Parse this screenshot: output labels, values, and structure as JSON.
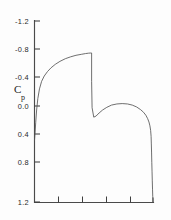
{
  "figure": {
    "background_color": "#fdfdfd",
    "line_color": "#555555",
    "axis_color": "#4a4a4a",
    "text_color": "#2a2a2a"
  },
  "axis": {
    "y_title_main": "C",
    "y_title_sub": "p",
    "y_tick_labels": [
      "-1.2",
      "-0.8",
      "-0.4",
      "0.0",
      "0.4",
      "0.8",
      "1.2"
    ]
  },
  "chart_data": {
    "type": "line",
    "title": "",
    "xlabel": "",
    "ylabel": "Cp",
    "xlim": [
      0,
      1
    ],
    "ylim": [
      1.2,
      -1.2
    ],
    "y_axis_inverted": true,
    "grid": false,
    "legend": null,
    "y_ticks": [
      -1.2,
      -0.8,
      -0.4,
      0.0,
      0.4,
      0.8,
      1.2
    ],
    "y_tick_labels": [
      "-1.2",
      "-0.8",
      "-0.4",
      "0.0",
      "0.4",
      "0.8",
      "1.2"
    ],
    "x_ticks": [
      0.0,
      0.2,
      0.4,
      0.6,
      0.8,
      1.0
    ],
    "x_tick_labels": [
      "",
      "",
      "",
      "",
      "",
      ""
    ],
    "series": [
      {
        "name": "Cp distribution",
        "x": [
          0.0,
          0.004,
          0.01,
          0.018,
          0.028,
          0.042,
          0.06,
          0.082,
          0.11,
          0.14,
          0.175,
          0.215,
          0.26,
          0.305,
          0.35,
          0.395,
          0.43,
          0.455,
          0.47,
          0.478,
          0.482,
          0.482,
          0.486,
          0.5,
          0.52,
          0.545,
          0.575,
          0.61,
          0.65,
          0.695,
          0.74,
          0.785,
          0.825,
          0.862,
          0.895,
          0.92,
          0.94,
          0.955,
          0.966,
          0.974,
          0.98,
          0.984,
          0.986,
          0.988,
          0.99,
          0.992,
          0.994,
          0.996,
          0.998,
          1.0
        ],
        "y": [
          0.38,
          0.3,
          0.15,
          -0.02,
          -0.17,
          -0.3,
          -0.4,
          -0.47,
          -0.53,
          -0.58,
          -0.625,
          -0.665,
          -0.7,
          -0.725,
          -0.745,
          -0.758,
          -0.768,
          -0.773,
          -0.775,
          -0.776,
          -0.776,
          -0.4,
          -0.05,
          0.075,
          0.06,
          0.02,
          -0.02,
          -0.055,
          -0.085,
          -0.1,
          -0.105,
          -0.1,
          -0.085,
          -0.06,
          -0.025,
          0.01,
          0.05,
          0.095,
          0.14,
          0.19,
          0.25,
          0.33,
          0.43,
          0.55,
          0.68,
          0.8,
          0.92,
          1.03,
          1.13,
          1.2
        ]
      }
    ],
    "annotations": {
      "shock_location_x": 0.48,
      "shock_cp_before": -0.776,
      "shock_cp_after": 0.075,
      "suction_peak_cp": -0.776,
      "stagnation_cp": 0.38,
      "trailing_edge_cp": 1.2
    }
  }
}
